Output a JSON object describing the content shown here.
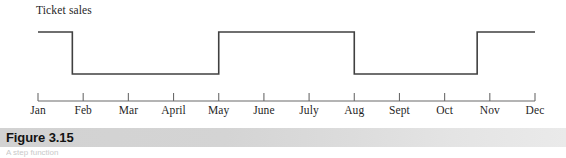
{
  "figure": {
    "caption_title": "Figure 3.15",
    "caption_subtext": "A step function"
  },
  "chart_data": {
    "type": "line",
    "subtype": "step",
    "title": "",
    "series_label": "Ticket sales",
    "xlabel": "",
    "ylabel": "Ticket sales",
    "grid": false,
    "legend": "none",
    "categories": [
      "Jan",
      "Feb",
      "Mar",
      "April",
      "May",
      "June",
      "July",
      "Aug",
      "Sept",
      "Oct",
      "Nov",
      "Dec"
    ],
    "tick_labels": [
      "Jan",
      "Feb",
      "Mar",
      "April",
      "May",
      "June",
      "July",
      "Aug",
      "Sept",
      "Oct",
      "Nov",
      "Dec"
    ],
    "y_levels": {
      "high": 1,
      "low": 0
    },
    "ylim": [
      0,
      1
    ],
    "line_color": "#404040",
    "axis_color": "#6b6b6b",
    "segments": [
      {
        "from": "Jan",
        "to": "late Jan",
        "level": "high"
      },
      {
        "from": "late Jan",
        "to": "May",
        "level": "low"
      },
      {
        "from": "May",
        "to": "Aug",
        "level": "high"
      },
      {
        "from": "Aug",
        "to": "late Oct",
        "level": "low"
      },
      {
        "from": "late Oct",
        "to": "Dec",
        "level": "high"
      }
    ],
    "points": [
      {
        "x": "Jan",
        "y": 1
      },
      {
        "x": "late Jan",
        "y": 1
      },
      {
        "x": "late Jan",
        "y": 0
      },
      {
        "x": "May",
        "y": 0
      },
      {
        "x": "May",
        "y": 1
      },
      {
        "x": "Aug",
        "y": 1
      },
      {
        "x": "Aug",
        "y": 0
      },
      {
        "x": "late Oct",
        "y": 0
      },
      {
        "x": "late Oct",
        "y": 1
      },
      {
        "x": "Dec",
        "y": 1
      }
    ]
  }
}
